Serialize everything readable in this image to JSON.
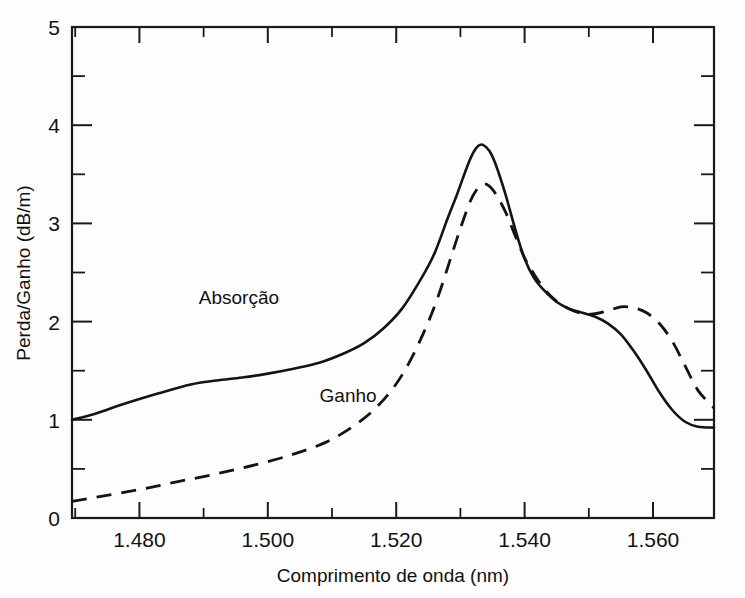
{
  "chart_data": {
    "type": "line",
    "title": "",
    "xlabel": "Comprimento de onda (nm)",
    "ylabel": "Perda/Ganho (dB/m)",
    "xlim": [
      1.4695,
      1.5695
    ],
    "ylim": [
      0,
      5
    ],
    "grid": false,
    "legend_position": "inline-annotation",
    "x_tick_labels": [
      "1.480",
      "1.500",
      "1.520",
      "1.540",
      "1.560"
    ],
    "x_tick_values": [
      1.48,
      1.5,
      1.52,
      1.54,
      1.56
    ],
    "x_minor_tick_values": [
      1.47,
      1.49,
      1.51,
      1.53,
      1.55,
      1.57
    ],
    "y_tick_labels": [
      "0",
      "1",
      "2",
      "3",
      "4",
      "5"
    ],
    "y_tick_values": [
      0,
      1,
      2,
      3,
      4,
      5
    ],
    "y_minor_tick_values": [
      0.5,
      1.5,
      2.5,
      3.5,
      4.5
    ],
    "series": [
      {
        "name": "Absorção",
        "style": "solid",
        "color": "#141414",
        "label_x": 1.4955,
        "label_y": 2.18,
        "x": [
          1.4695,
          1.473,
          1.478,
          1.483,
          1.488,
          1.492,
          1.496,
          1.5,
          1.504,
          1.508,
          1.512,
          1.515,
          1.518,
          1.521,
          1.524,
          1.526,
          1.528,
          1.5295,
          1.531,
          1.532,
          1.5328,
          1.5335,
          1.5345,
          1.5355,
          1.537,
          1.5385,
          1.54,
          1.5415,
          1.543,
          1.545,
          1.547,
          1.549,
          1.551,
          1.553,
          1.555,
          1.557,
          1.559,
          1.561,
          1.563,
          1.565,
          1.567,
          1.5695
        ],
        "y": [
          1.0,
          1.06,
          1.17,
          1.27,
          1.36,
          1.4,
          1.43,
          1.47,
          1.52,
          1.58,
          1.68,
          1.78,
          1.93,
          2.14,
          2.45,
          2.7,
          3.05,
          3.3,
          3.57,
          3.72,
          3.79,
          3.8,
          3.74,
          3.6,
          3.3,
          2.95,
          2.64,
          2.44,
          2.32,
          2.2,
          2.13,
          2.09,
          2.05,
          1.98,
          1.87,
          1.7,
          1.5,
          1.28,
          1.1,
          0.98,
          0.93,
          0.92
        ]
      },
      {
        "name": "Ganho",
        "style": "dashed",
        "color": "#141414",
        "label_x": 1.5125,
        "label_y": 1.18,
        "x": [
          1.4695,
          1.474,
          1.48,
          1.486,
          1.492,
          1.498,
          1.504,
          1.509,
          1.513,
          1.5165,
          1.5195,
          1.522,
          1.5245,
          1.5265,
          1.5285,
          1.53,
          1.5315,
          1.5325,
          1.5335,
          1.5345,
          1.5355,
          1.537,
          1.5385,
          1.54,
          1.5415,
          1.5435,
          1.546,
          1.549,
          1.551,
          1.553,
          1.555,
          1.557,
          1.559,
          1.561,
          1.563,
          1.565,
          1.567,
          1.5695
        ],
        "y": [
          0.17,
          0.22,
          0.29,
          0.37,
          0.45,
          0.54,
          0.65,
          0.77,
          0.92,
          1.1,
          1.32,
          1.58,
          1.92,
          2.25,
          2.65,
          2.95,
          3.22,
          3.34,
          3.4,
          3.38,
          3.3,
          3.12,
          2.88,
          2.65,
          2.48,
          2.3,
          2.16,
          2.08,
          2.08,
          2.11,
          2.15,
          2.14,
          2.09,
          1.98,
          1.8,
          1.55,
          1.3,
          1.12
        ]
      }
    ]
  },
  "axes": {
    "x_label": "Comprimento de onda (nm)",
    "y_label": "Perda/Ganho (dB/m)"
  }
}
